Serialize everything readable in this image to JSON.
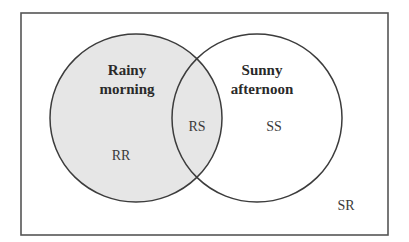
{
  "diagram": {
    "type": "venn",
    "universe_label": "SR",
    "sets": [
      {
        "name": "Rainy morning",
        "line1": "Rainy",
        "line2": "morning",
        "region_label": "RR",
        "fill": "#e6e6e6"
      },
      {
        "name": "Sunny afternoon",
        "line1": "Sunny",
        "line2": "afternoon",
        "region_label": "SS",
        "fill": "#ffffff"
      }
    ],
    "intersection_label": "RS",
    "colors": {
      "stroke": "#3c3c3c",
      "shaded": "#e6e6e6",
      "background": "#ffffff"
    }
  }
}
